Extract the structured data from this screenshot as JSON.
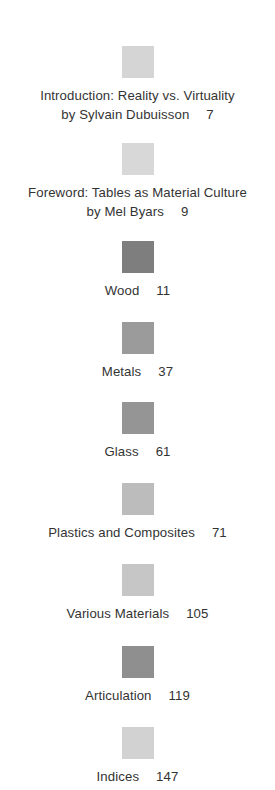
{
  "page": {
    "kind": "table-of-contents",
    "background_color": "#ffffff",
    "text_color": "#333333"
  },
  "entries": [
    {
      "swatch_color": "#d5d5d5",
      "line1": "Introduction: Reality vs. Virtuality",
      "line2": "by Sylvain Dubuisson",
      "page": "7"
    },
    {
      "swatch_color": "#d8d8d8",
      "line1": "Foreword: Tables as Material Culture",
      "line2": "by Mel Byars",
      "page": "9"
    },
    {
      "swatch_color": "#7e7e7e",
      "line1": "Wood",
      "line2": "",
      "page": "11"
    },
    {
      "swatch_color": "#9b9b9b",
      "line1": "Metals",
      "line2": "",
      "page": "37"
    },
    {
      "swatch_color": "#959595",
      "line1": "Glass",
      "line2": "",
      "page": "61"
    },
    {
      "swatch_color": "#bcbcbc",
      "line1": "Plastics and Composites",
      "line2": "",
      "page": "71"
    },
    {
      "swatch_color": "#c6c6c6",
      "line1": "Various Materials",
      "line2": "",
      "page": "105"
    },
    {
      "swatch_color": "#8f8f8f",
      "line1": "Articulation",
      "line2": "",
      "page": "119"
    },
    {
      "swatch_color": "#d2d2d2",
      "line1": "Indices",
      "line2": "",
      "page": "147"
    }
  ]
}
